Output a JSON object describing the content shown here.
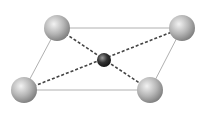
{
  "diagram": {
    "colors": {
      "edge": "#b0b0b0",
      "dash": "#444444",
      "corner_atom": "#b8b8b8",
      "center_atom": "#333333"
    },
    "corner_atoms": [
      {
        "id": "top-left",
        "cx": 57,
        "cy": 28,
        "r": 13
      },
      {
        "id": "top-right",
        "cx": 182,
        "cy": 28,
        "r": 13
      },
      {
        "id": "bottom-left",
        "cx": 24,
        "cy": 90,
        "r": 13
      },
      {
        "id": "bottom-right",
        "cx": 150,
        "cy": 90,
        "r": 13
      }
    ],
    "center_atom": {
      "cx": 104,
      "cy": 60,
      "r": 7
    }
  }
}
